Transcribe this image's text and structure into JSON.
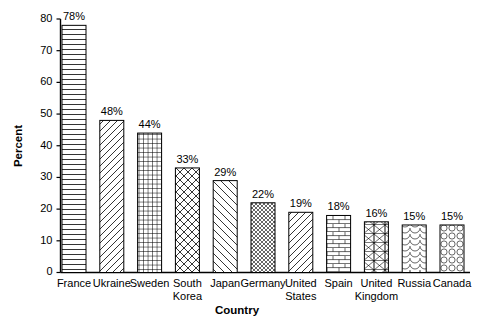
{
  "chart_data": {
    "type": "bar",
    "title": "",
    "xlabel": "Country",
    "ylabel": "Percent",
    "ylim": [
      0,
      80
    ],
    "ytick_values": [
      0,
      10,
      20,
      30,
      40,
      50,
      60,
      70,
      80
    ],
    "ytick_labels": [
      "0",
      "10",
      "20",
      "30",
      "40",
      "50",
      "60",
      "70",
      "80"
    ],
    "grid": false,
    "legend": "none",
    "value_label_suffix": "%",
    "categories": [
      "France",
      "Ukraine",
      "Sweden",
      "South Korea",
      "Japan",
      "Germany",
      "United States",
      "Spain",
      "United Kingdom",
      "Russia",
      "Canada"
    ],
    "values": [
      78,
      48,
      44,
      33,
      29,
      22,
      19,
      18,
      16,
      15,
      15
    ],
    "value_labels": [
      "78%",
      "48%",
      "44%",
      "33%",
      "29%",
      "22%",
      "19%",
      "18%",
      "16%",
      "15%",
      "15%"
    ],
    "category_lines": [
      [
        "France"
      ],
      [
        "Ukraine"
      ],
      [
        "Sweden"
      ],
      [
        "South",
        "Korea"
      ],
      [
        "Japan"
      ],
      [
        "Germany"
      ],
      [
        "United",
        "States"
      ],
      [
        "Spain"
      ],
      [
        "United",
        "Kingdom"
      ],
      [
        "Russia"
      ],
      [
        "Canada"
      ]
    ],
    "bar_patterns": [
      "horizontal-lines",
      "diagonal-forward",
      "square-grid",
      "diagonal-crosshatch",
      "diagonal-backward",
      "fine-diagonal-crosshatch",
      "diagonal-forward-wide",
      "brick",
      "boxed-x",
      "fish-scale",
      "circles"
    ],
    "colors": {
      "background": "#ffffff",
      "axis": "#000000",
      "bar_outline": "#000000",
      "bar_fill": "#ffffff",
      "text": "#000000"
    }
  }
}
